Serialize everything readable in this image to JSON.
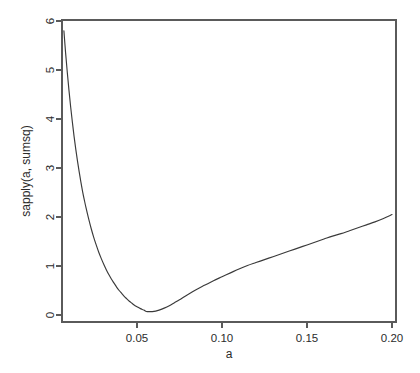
{
  "chart_data": {
    "type": "line",
    "title": "",
    "subtitle": "",
    "xlabel": "a",
    "ylabel": "sapply(a, sumsq)",
    "xlim": [
      0.0,
      0.205
    ],
    "ylim": [
      -0.08,
      6.1
    ],
    "grid": false,
    "legend": null,
    "xticks": [
      0.05,
      0.1,
      0.15,
      0.2
    ],
    "xtick_labels": [
      "0.05",
      "0.10",
      "0.15",
      "0.20"
    ],
    "yticks": [
      0,
      1,
      2,
      3,
      4,
      5,
      6
    ],
    "ytick_labels": [
      "0",
      "1",
      "2",
      "3",
      "4",
      "5",
      "6"
    ],
    "line_color": "#3a3a3a",
    "axis_color": "#5a5a5a",
    "background_color": "#ffffff",
    "annotations": [],
    "series": [
      {
        "name": "sapply(a, sumsq)",
        "x": [
          0.007,
          0.008,
          0.009,
          0.01,
          0.011,
          0.012,
          0.013,
          0.014,
          0.015,
          0.016,
          0.017,
          0.018,
          0.019,
          0.02,
          0.0215,
          0.023,
          0.0245,
          0.026,
          0.0275,
          0.029,
          0.0305,
          0.032,
          0.0335,
          0.035,
          0.0365,
          0.038,
          0.0395,
          0.041,
          0.0425,
          0.044,
          0.0455,
          0.047,
          0.0485,
          0.05,
          0.052,
          0.054,
          0.0555,
          0.057,
          0.059,
          0.061,
          0.063,
          0.066,
          0.069,
          0.072,
          0.075,
          0.08,
          0.085,
          0.09,
          0.095,
          0.1,
          0.105,
          0.11,
          0.115,
          0.12,
          0.125,
          0.13,
          0.135,
          0.14,
          0.145,
          0.15,
          0.155,
          0.16,
          0.165,
          0.17,
          0.175,
          0.18,
          0.185,
          0.19,
          0.195,
          0.2
        ],
        "y": [
          5.8,
          5.35,
          4.95,
          4.58,
          4.24,
          3.93,
          3.64,
          3.38,
          3.14,
          2.92,
          2.71,
          2.52,
          2.35,
          2.19,
          1.97,
          1.77,
          1.59,
          1.43,
          1.28,
          1.15,
          1.03,
          0.92,
          0.82,
          0.73,
          0.65,
          0.57,
          0.5,
          0.44,
          0.38,
          0.33,
          0.28,
          0.24,
          0.2,
          0.17,
          0.13,
          0.1,
          0.07,
          0.07,
          0.07,
          0.08,
          0.1,
          0.14,
          0.19,
          0.25,
          0.31,
          0.42,
          0.52,
          0.61,
          0.7,
          0.78,
          0.86,
          0.94,
          1.01,
          1.07,
          1.13,
          1.19,
          1.25,
          1.31,
          1.37,
          1.43,
          1.49,
          1.55,
          1.61,
          1.66,
          1.72,
          1.78,
          1.84,
          1.9,
          1.97,
          2.05
        ]
      }
    ]
  }
}
